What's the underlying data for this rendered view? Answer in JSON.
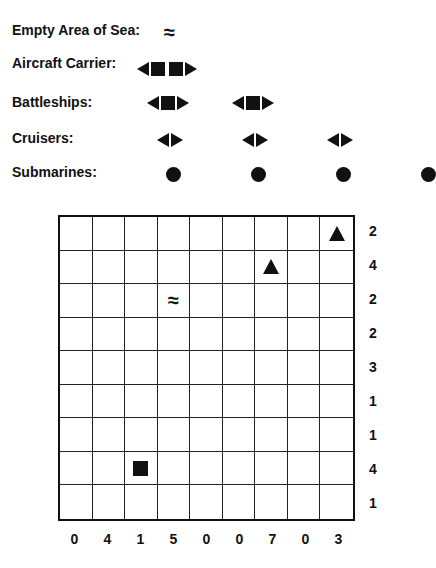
{
  "legend": {
    "empty_sea": {
      "label": "Empty Area of Sea:",
      "symbol": "≈",
      "icon": "wave-icon"
    },
    "aircraft_carrier": {
      "label": "Aircraft Carrier:",
      "count": 1,
      "length": 4
    },
    "battleships": {
      "label": "Battleships:",
      "count": 2,
      "length": 3
    },
    "cruisers": {
      "label": "Cruisers:",
      "count": 3,
      "length": 2
    },
    "submarines": {
      "label": "Submarines:",
      "count": 4,
      "length": 1
    }
  },
  "board": {
    "rows": 9,
    "cols": 9,
    "row_clues": [
      "2",
      "4",
      "2",
      "2",
      "3",
      "1",
      "1",
      "4",
      "1"
    ],
    "col_clues": [
      "0",
      "4",
      "1",
      "5",
      "0",
      "0",
      "7",
      "0",
      "3"
    ],
    "given_cells": [
      {
        "row": 0,
        "col": 8,
        "type": "ship-end-top",
        "icon": "triangle-up-icon"
      },
      {
        "row": 1,
        "col": 6,
        "type": "ship-end-top",
        "icon": "triangle-up-icon"
      },
      {
        "row": 2,
        "col": 3,
        "type": "water",
        "symbol": "≈",
        "icon": "wave-icon"
      },
      {
        "row": 7,
        "col": 2,
        "type": "ship-middle",
        "icon": "square-icon"
      }
    ]
  },
  "colors": {
    "ink": "#111111",
    "background": "#ffffff"
  }
}
